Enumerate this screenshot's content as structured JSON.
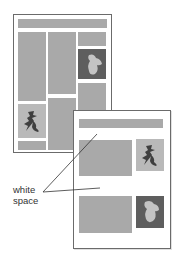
{
  "diagram": {
    "label_line1": "white",
    "label_line2": "space",
    "colors": {
      "block": "#a9a9a9",
      "image_light": "#b9b9b9",
      "image_dark": "#5e5e5e",
      "border": "#6b6b6b",
      "glyph_dark": "#3f3f3f",
      "glyph_light": "#c4c4c4"
    },
    "pages": [
      {
        "name": "crowded-layout",
        "description": "dense multi-column page"
      },
      {
        "name": "spacious-layout",
        "description": "page with generous white space"
      }
    ],
    "icons": [
      "calligraphy-image-icon",
      "blob-image-icon"
    ]
  }
}
